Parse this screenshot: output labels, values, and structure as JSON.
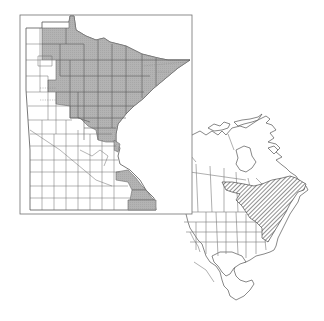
{
  "figure": {
    "type": "species-distribution-map",
    "top_caption_cut_off": true,
    "colors": {
      "background": "#ffffff",
      "frame": "#707070",
      "county_border": "#6a6a6a",
      "occupied_county_fill": "#b3b3b3",
      "range_hatch": "#333333",
      "coastline": "#555555"
    }
  },
  "minnesota_map": {
    "label": "Minnesota county distribution",
    "frame": {
      "x": 20,
      "y": 15,
      "width": 172,
      "height": 199
    },
    "legend": {
      "shaded": "counties with recorded occurrence",
      "unshaded": "no record"
    },
    "shaded_regions": [
      "northern / north-central counties",
      "arrowhead (northeast) counties",
      "southeast (Mississippi river bluff) counties"
    ]
  },
  "north_america_map": {
    "label": "North American range",
    "range_pattern": "diagonal hatching",
    "range_description": "eastern Canada and northeastern United States, Great Lakes to Atlantic coast"
  }
}
